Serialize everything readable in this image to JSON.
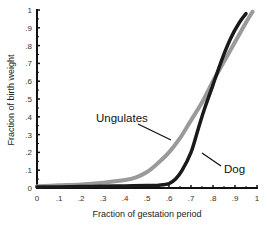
{
  "chart_data": {
    "type": "line",
    "title": "",
    "xlabel": "Fraction of gestation period",
    "ylabel": "Fraction of birth weight",
    "xlim": [
      0,
      1
    ],
    "ylim": [
      0,
      1
    ],
    "x_ticks": [
      "0",
      ".1",
      ".2",
      ".3",
      ".4",
      ".5",
      ".6",
      ".7",
      ".8",
      ".9",
      "1"
    ],
    "y_ticks": [
      "0",
      ".1",
      ".2",
      ".3",
      ".4",
      ".5",
      ".6",
      ".7",
      ".8",
      ".9",
      "1"
    ],
    "grid": false,
    "legend": "none (direct annotations)",
    "series": [
      {
        "name": "Ungulates",
        "color": "#9a9a9a",
        "x": [
          0,
          0.1,
          0.2,
          0.3,
          0.4,
          0.45,
          0.5,
          0.55,
          0.6,
          0.65,
          0.7,
          0.75,
          0.8,
          0.85,
          0.9,
          0.95,
          0.98
        ],
        "values": [
          0.01,
          0.015,
          0.02,
          0.03,
          0.045,
          0.06,
          0.09,
          0.14,
          0.2,
          0.28,
          0.38,
          0.48,
          0.6,
          0.71,
          0.82,
          0.93,
          0.99
        ]
      },
      {
        "name": "Dog",
        "color": "#1a1a1a",
        "x": [
          0,
          0.1,
          0.2,
          0.3,
          0.4,
          0.5,
          0.55,
          0.6,
          0.63,
          0.66,
          0.7,
          0.73,
          0.76,
          0.8,
          0.84,
          0.88,
          0.92,
          0.95
        ],
        "values": [
          0.005,
          0.006,
          0.008,
          0.01,
          0.012,
          0.014,
          0.016,
          0.025,
          0.05,
          0.1,
          0.2,
          0.32,
          0.44,
          0.58,
          0.72,
          0.84,
          0.93,
          0.98
        ]
      }
    ],
    "annotations": [
      {
        "text": "Ungulates",
        "points_to": "Ungulates",
        "approx_xy": [
          0.38,
          0.43
        ]
      },
      {
        "text": "Dog",
        "points_to": "Dog",
        "approx_xy": [
          0.85,
          0.15
        ]
      }
    ]
  },
  "labels": {
    "xlabel": "Fraction of gestation period",
    "ylabel": "Fraction of birth weight",
    "ungulates": "Ungulates",
    "dog": "Dog"
  }
}
